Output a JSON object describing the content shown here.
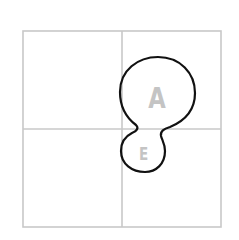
{
  "diagram": {
    "type": "2x2 grid with blob outline",
    "grid": {
      "rows": 2,
      "cols": 2,
      "line_color": "#c8c8c8"
    },
    "shape": {
      "stroke_color": "#111111",
      "description": "closed blob spanning top-right and bottom-right quadrants near the center"
    },
    "labels": {
      "large": "A",
      "small": "E"
    },
    "label_color": "#c4c4c4"
  }
}
